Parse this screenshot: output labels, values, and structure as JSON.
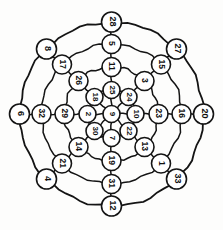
{
  "figure": {
    "ring_count": 4,
    "spoke_count": 8,
    "node_count": 33,
    "stroke_color": "#141414",
    "node_fill": "#ffffff",
    "background": "#fdfdfc"
  },
  "center": {
    "id": "center",
    "label": "9",
    "cx": 111.5,
    "cy": 114,
    "r": 8.5,
    "rot": 90
  },
  "rings": [
    {
      "name": "ring-1-inner",
      "radius": 24
    },
    {
      "name": "ring-2",
      "radius": 47
    },
    {
      "name": "ring-3",
      "radius": 70
    },
    {
      "name": "ring-4-outer",
      "radius": 92
    }
  ],
  "spokes": [
    {
      "name": "spoke-n",
      "angle": -90
    },
    {
      "name": "spoke-ne",
      "angle": -45
    },
    {
      "name": "spoke-e",
      "angle": 0
    },
    {
      "name": "spoke-se",
      "angle": 45
    },
    {
      "name": "spoke-s",
      "angle": 90
    },
    {
      "name": "spoke-sw",
      "angle": 135
    },
    {
      "name": "spoke-w",
      "angle": 180
    },
    {
      "name": "spoke-nw",
      "angle": -135
    }
  ],
  "nodes": [
    {
      "label": "9",
      "cx": 111.5,
      "cy": 114,
      "r": 8.5,
      "rot": 90,
      "ring": 0,
      "spoke": "center"
    },
    {
      "label": "25",
      "cx": 111.5,
      "cy": 90,
      "r": 8.5,
      "rot": 90,
      "ring": 1,
      "spoke": "spoke-n"
    },
    {
      "label": "24",
      "cx": 128.5,
      "cy": 97,
      "r": 8.5,
      "rot": 90,
      "ring": 1,
      "spoke": "spoke-ne"
    },
    {
      "label": "10",
      "cx": 135.5,
      "cy": 114,
      "r": 8.5,
      "rot": 90,
      "ring": 1,
      "spoke": "spoke-e"
    },
    {
      "label": "22",
      "cx": 128.5,
      "cy": 131,
      "r": 8.5,
      "rot": 90,
      "ring": 1,
      "spoke": "spoke-se"
    },
    {
      "label": "7",
      "cx": 111.5,
      "cy": 138,
      "r": 8.5,
      "rot": 90,
      "ring": 1,
      "spoke": "spoke-s"
    },
    {
      "label": "30",
      "cx": 94.5,
      "cy": 131,
      "r": 8.5,
      "rot": 90,
      "ring": 1,
      "spoke": "spoke-sw"
    },
    {
      "label": "2",
      "cx": 87.5,
      "cy": 114,
      "r": 8.5,
      "rot": 90,
      "ring": 1,
      "spoke": "spoke-w"
    },
    {
      "label": "18",
      "cx": 94.5,
      "cy": 97,
      "r": 8.5,
      "rot": 90,
      "ring": 1,
      "spoke": "spoke-nw"
    },
    {
      "label": "11",
      "cx": 111.5,
      "cy": 67,
      "r": 9.5,
      "rot": 90,
      "ring": 2,
      "spoke": "spoke-n"
    },
    {
      "label": "3",
      "cx": 144.5,
      "cy": 81,
      "r": 9.5,
      "rot": 90,
      "ring": 2,
      "spoke": "spoke-ne"
    },
    {
      "label": "23",
      "cx": 158.5,
      "cy": 114,
      "r": 9.5,
      "rot": 90,
      "ring": 2,
      "spoke": "spoke-e"
    },
    {
      "label": "13",
      "cx": 144.5,
      "cy": 147,
      "r": 9.5,
      "rot": 90,
      "ring": 2,
      "spoke": "spoke-se"
    },
    {
      "label": "19",
      "cx": 111.5,
      "cy": 161,
      "r": 9.5,
      "rot": 90,
      "ring": 2,
      "spoke": "spoke-s"
    },
    {
      "label": "14",
      "cx": 78.5,
      "cy": 147,
      "r": 9.5,
      "rot": 90,
      "ring": 2,
      "spoke": "spoke-sw"
    },
    {
      "label": "29",
      "cx": 64.5,
      "cy": 114,
      "r": 9.5,
      "rot": 90,
      "ring": 2,
      "spoke": "spoke-w"
    },
    {
      "label": "26",
      "cx": 78.5,
      "cy": 81,
      "r": 9.5,
      "rot": 90,
      "ring": 2,
      "spoke": "spoke-nw"
    },
    {
      "label": "5",
      "cx": 111.5,
      "cy": 44,
      "r": 9.5,
      "rot": 90,
      "ring": 3,
      "spoke": "spoke-n"
    },
    {
      "label": "15",
      "cx": 161,
      "cy": 64.5,
      "r": 9.5,
      "rot": 90,
      "ring": 3,
      "spoke": "spoke-ne"
    },
    {
      "label": "16",
      "cx": 181.5,
      "cy": 114,
      "r": 9.5,
      "rot": 90,
      "ring": 3,
      "spoke": "spoke-e"
    },
    {
      "label": "1",
      "cx": 161,
      "cy": 163.5,
      "r": 9.5,
      "rot": 90,
      "ring": 3,
      "spoke": "spoke-se"
    },
    {
      "label": "31",
      "cx": 111.5,
      "cy": 184,
      "r": 9.5,
      "rot": 90,
      "ring": 3,
      "spoke": "spoke-s"
    },
    {
      "label": "21",
      "cx": 62,
      "cy": 163.5,
      "r": 9.5,
      "rot": 90,
      "ring": 3,
      "spoke": "spoke-sw"
    },
    {
      "label": "32",
      "cx": 41.5,
      "cy": 114,
      "r": 9.5,
      "rot": 90,
      "ring": 3,
      "spoke": "spoke-w"
    },
    {
      "label": "17",
      "cx": 62,
      "cy": 64.5,
      "r": 9.5,
      "rot": 90,
      "ring": 3,
      "spoke": "spoke-nw"
    },
    {
      "label": "28",
      "cx": 111.5,
      "cy": 22,
      "r": 10,
      "rot": 90,
      "ring": 4,
      "spoke": "spoke-n"
    },
    {
      "label": "27",
      "cx": 176.5,
      "cy": 49,
      "r": 10,
      "rot": 90,
      "ring": 4,
      "spoke": "spoke-ne"
    },
    {
      "label": "20",
      "cx": 203.5,
      "cy": 114,
      "r": 10,
      "rot": 90,
      "ring": 4,
      "spoke": "spoke-e"
    },
    {
      "label": "33",
      "cx": 176.5,
      "cy": 179,
      "r": 10,
      "rot": 90,
      "ring": 4,
      "spoke": "spoke-se"
    },
    {
      "label": "12",
      "cx": 111.5,
      "cy": 206,
      "r": 10,
      "rot": 90,
      "ring": 4,
      "spoke": "spoke-s"
    },
    {
      "label": "4",
      "cx": 46.5,
      "cy": 179,
      "r": 10,
      "rot": 90,
      "ring": 4,
      "spoke": "spoke-sw"
    },
    {
      "label": "6",
      "cx": 19.5,
      "cy": 114,
      "r": 10,
      "rot": 90,
      "ring": 4,
      "spoke": "spoke-w"
    },
    {
      "label": "8",
      "cx": 46.5,
      "cy": 49,
      "r": 10,
      "rot": 90,
      "ring": 4,
      "spoke": "spoke-nw"
    }
  ]
}
